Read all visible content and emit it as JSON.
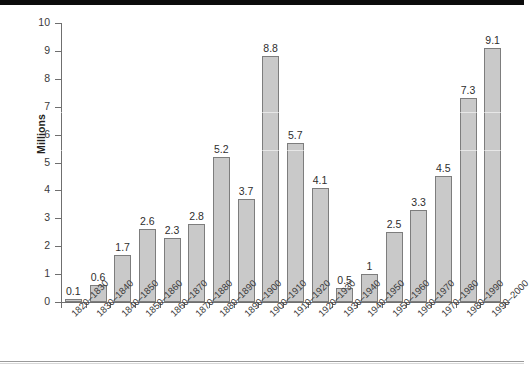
{
  "figure": {
    "background_color": "#ffffff",
    "bar_fill_color": "#c9c9c9",
    "bar_border_color": "#7d7d7d",
    "axis_color": "#6f6f6f"
  },
  "chart_data": {
    "type": "bar",
    "title": "",
    "xlabel": "",
    "ylabel": "Millions",
    "ylim": [
      0,
      10
    ],
    "ytick_labels": [
      "0",
      "1",
      "2",
      "3",
      "4",
      "5",
      "6",
      "7",
      "8",
      "9",
      "10"
    ],
    "grid": false,
    "legend": null,
    "categories": [
      "1820–1830",
      "1830–1840",
      "1840–1850",
      "1850–1860",
      "1860–1870",
      "1870–1880",
      "1880–1890",
      "1890–1900",
      "1900–1910",
      "1910–1920",
      "1920–1930",
      "1930–1940",
      "1940–1950",
      "1950–1960",
      "1960–1970",
      "1970–1980",
      "1980–1990",
      "1990–2000"
    ],
    "values": [
      0.1,
      0.6,
      1.7,
      2.6,
      2.3,
      2.8,
      5.2,
      3.7,
      8.8,
      5.7,
      4.1,
      0.5,
      1,
      2.5,
      3.3,
      4.5,
      7.3,
      9.1
    ],
    "value_labels": [
      "0.1",
      "0.6",
      "1.7",
      "2.6",
      "2.3",
      "2.8",
      "5.2",
      "3.7",
      "8.8",
      "5.7",
      "4.1",
      "0.5",
      "1",
      "2.5",
      "3.3",
      "4.5",
      "7.3",
      "9.1"
    ]
  }
}
